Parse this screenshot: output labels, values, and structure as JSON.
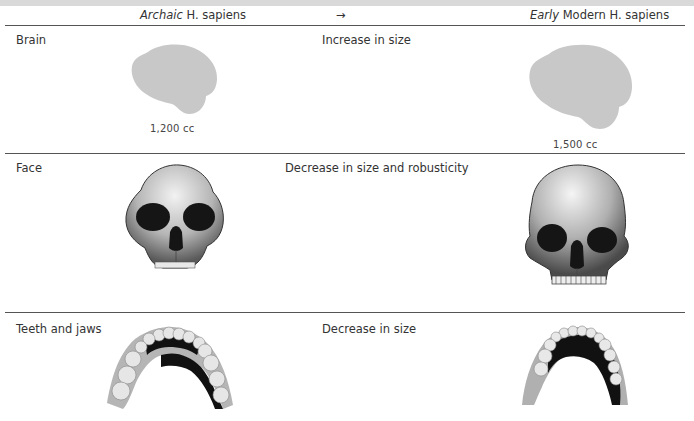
{
  "header": {
    "left_italic": "Archaic",
    "left_rest": " H. sapiens",
    "arrow": "→",
    "right_italic": "Early",
    "right_rest": " Modern H. sapiens"
  },
  "rows": [
    {
      "label": "Brain",
      "change": "Increase in size",
      "left_caption": "1,200 cc",
      "right_caption": "1,500 cc",
      "left_figure": "brain-icon",
      "right_figure": "brain-icon"
    },
    {
      "label": "Face",
      "change": "Decrease in size and robusticity",
      "left_figure": "archaic-skull-icon",
      "right_figure": "modern-skull-icon"
    },
    {
      "label": "Teeth and jaws",
      "change": "Decrease in size",
      "left_figure": "archaic-jaw-icon",
      "right_figure": "modern-jaw-icon"
    }
  ],
  "colors": {
    "brain_fill": "#c8c8c8",
    "rule": "#555555",
    "top_band": "#d9d9d9"
  }
}
